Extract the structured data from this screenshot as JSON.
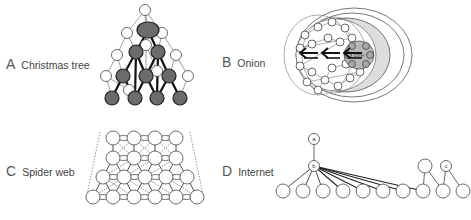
{
  "figure": {
    "panels": [
      {
        "id": "A",
        "letter": "A",
        "title": "Christmas tree",
        "label_pos": [
          6,
          56
        ]
      },
      {
        "id": "B",
        "letter": "B",
        "title": "Onion",
        "label_pos": [
          222,
          54
        ]
      },
      {
        "id": "C",
        "letter": "C",
        "title": "Spider web",
        "label_pos": [
          6,
          163
        ]
      },
      {
        "id": "D",
        "letter": "D",
        "title": "Internet",
        "label_pos": [
          222,
          163
        ]
      }
    ],
    "christmas_tree": {
      "dark_color": "#6b6b6b",
      "dark_nodes": [
        [
          148,
          30,
          11,
          8
        ],
        [
          136,
          52,
          7,
          7
        ],
        [
          158,
          52,
          7,
          7
        ],
        [
          123,
          76,
          7,
          7
        ],
        [
          146,
          76,
          7,
          7
        ],
        [
          169,
          76,
          7,
          7
        ],
        [
          112,
          98,
          7,
          7
        ],
        [
          135,
          98,
          7,
          7
        ],
        [
          157,
          98,
          7,
          7
        ],
        [
          180,
          98,
          7,
          7
        ]
      ],
      "dark_edges": [
        [
          0,
          1
        ],
        [
          0,
          2
        ],
        [
          1,
          3
        ],
        [
          1,
          4
        ],
        [
          2,
          4
        ],
        [
          2,
          5
        ],
        [
          3,
          6
        ],
        [
          3,
          7
        ],
        [
          4,
          7
        ],
        [
          4,
          8
        ],
        [
          5,
          8
        ],
        [
          5,
          9
        ],
        [
          1,
          7
        ],
        [
          2,
          8
        ]
      ],
      "white_nodes": [
        [
          145,
          10
        ],
        [
          127,
          33
        ],
        [
          162,
          33
        ],
        [
          117,
          55
        ],
        [
          146,
          45
        ],
        [
          176,
          55
        ],
        [
          106,
          76
        ],
        [
          157,
          71
        ],
        [
          188,
          76
        ],
        [
          129,
          90
        ]
      ],
      "white_edges": [
        [
          0,
          0
        ],
        [
          1,
          0
        ],
        [
          2,
          0
        ],
        [
          3,
          1
        ],
        [
          4,
          0
        ],
        [
          5,
          2
        ],
        [
          6,
          3
        ],
        [
          7,
          4
        ],
        [
          8,
          5
        ],
        [
          9,
          6
        ]
      ],
      "white_to_dark": [
        [
          1,
          1
        ],
        [
          2,
          2
        ],
        [
          3,
          3
        ],
        [
          4,
          4
        ],
        [
          5,
          5
        ],
        [
          6,
          6
        ],
        [
          7,
          8
        ],
        [
          8,
          9
        ],
        [
          9,
          7
        ]
      ]
    },
    "onion": {
      "core_label": "core",
      "core_fill": "#b8b8b8",
      "middle_fill": "#dddddd",
      "rings": [
        [
          354,
          55,
          58,
          47
        ],
        [
          352,
          55,
          52,
          42
        ],
        [
          346,
          55,
          44,
          37
        ]
      ],
      "core": [
        359,
        55,
        15,
        14
      ],
      "arrows_x": [
        300,
        322,
        344
      ],
      "arrows_y": 55
    },
    "spider_web": {
      "rows": [
        {
          "y": 138,
          "xs": [
            113,
            134,
            155,
            176
          ]
        },
        {
          "y": 158,
          "xs": [
            113,
            134,
            155,
            176
          ]
        },
        {
          "y": 177,
          "xs": [
            103,
            124,
            145,
            166,
            187
          ]
        },
        {
          "y": 197,
          "xs": [
            93,
            113,
            134,
            155,
            176,
            197
          ]
        }
      ],
      "node_r": 7
    },
    "internet": {
      "nodes": {
        "a": {
          "x": 314,
          "y": 139,
          "label": "a"
        },
        "b": {
          "x": 314,
          "y": 166,
          "label": "b"
        },
        "c": {
          "x": 446,
          "y": 166,
          "label": "c"
        },
        "r1": {
          "x": 425,
          "y": 166,
          "label": ""
        }
      },
      "bottom_y": 191,
      "bottom_xs": [
        283,
        303,
        323,
        343,
        363,
        383,
        403,
        423,
        443,
        463
      ],
      "node_r": 7
    }
  }
}
